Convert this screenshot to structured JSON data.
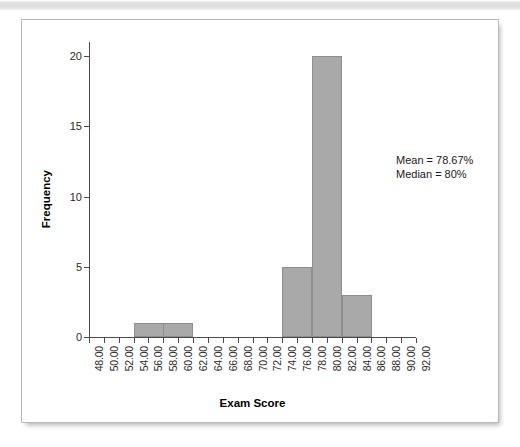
{
  "panel": {
    "background": "#ffffff",
    "border_color": "#b9b9b9"
  },
  "top_band": {
    "color": "#dcdcdc"
  },
  "chart_data": {
    "type": "bar",
    "title": "",
    "subtitle": "",
    "xlabel": "Exam Score",
    "ylabel": "Frequency",
    "xlim": [
      48,
      92
    ],
    "ylim": [
      0,
      21
    ],
    "grid": false,
    "legend": false,
    "bar_color": "#a9a9a9",
    "bar_border_color": "#8e8e8e",
    "bin_width": 4,
    "x_tick_labels": [
      "48.00",
      "50.00",
      "52.00",
      "54.00",
      "56.00",
      "58.00",
      "60.00",
      "62.00",
      "64.00",
      "66.00",
      "68.00",
      "70.00",
      "72.00",
      "74.00",
      "76.00",
      "78.00",
      "80.00",
      "82.00",
      "84.00",
      "86.00",
      "88.00",
      "90.00",
      "92.00"
    ],
    "x_tick_values": [
      48,
      50,
      52,
      54,
      56,
      58,
      60,
      62,
      64,
      66,
      68,
      70,
      72,
      74,
      76,
      78,
      80,
      82,
      84,
      86,
      88,
      90,
      92
    ],
    "y_tick_labels": [
      "0",
      "5",
      "10",
      "15",
      "20"
    ],
    "y_tick_values": [
      0,
      5,
      10,
      15,
      20
    ],
    "bins": [
      {
        "start": 54,
        "end": 58,
        "value": 1
      },
      {
        "start": 58,
        "end": 62,
        "value": 1
      },
      {
        "start": 74,
        "end": 78,
        "value": 5
      },
      {
        "start": 78,
        "end": 82,
        "value": 20
      },
      {
        "start": 82,
        "end": 86,
        "value": 3
      }
    ],
    "categories": [
      "54-58",
      "58-62",
      "74-78",
      "78-82",
      "82-86"
    ],
    "values": [
      1,
      1,
      5,
      20,
      3
    ],
    "annotations": [
      {
        "text": "Mean = 78.67%"
      },
      {
        "text": "Median = 80%"
      }
    ]
  }
}
